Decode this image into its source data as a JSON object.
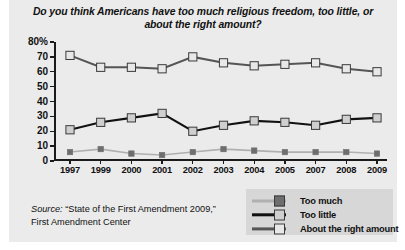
{
  "title": "Do you think Americans have too much religious freedom, too little, or about the right amount?",
  "source": {
    "prefix": "Source:",
    "line1": " “State of the First Amendment 2009,”",
    "line2": "First Amendment Center"
  },
  "legend": {
    "items": [
      {
        "label": "Too much",
        "line_color": "#b0b0b0",
        "marker_color": "#6e6e6e"
      },
      {
        "label": "Too little",
        "line_color": "#111111",
        "marker_color": "#cfcfcf"
      },
      {
        "label": "About the right amount",
        "line_color": "#555555",
        "marker_color": "#e8e8e8"
      }
    ]
  },
  "axis": {
    "y_labels": [
      "80%",
      "70",
      "60",
      "50",
      "40",
      "30",
      "20",
      "10",
      "0"
    ],
    "y_values": [
      80,
      70,
      60,
      50,
      40,
      30,
      20,
      10,
      0
    ]
  },
  "chart_data": {
    "type": "line",
    "title": "Do you think Americans have too much religious freedom, too little, or about the right amount?",
    "xlabel": "",
    "ylabel": "",
    "ylim": [
      0,
      80
    ],
    "ytick_interval": 10,
    "grid": false,
    "legend_position": "bottom-right",
    "categories": [
      "1997",
      "1999",
      "2000",
      "2001",
      "2002",
      "2003",
      "2004",
      "2005",
      "2007",
      "2008",
      "2009"
    ],
    "series": [
      {
        "name": "About the right amount",
        "values": [
          71,
          63,
          63,
          62,
          70,
          66,
          64,
          65,
          66,
          62,
          60
        ],
        "line_color": "#555555",
        "marker_color": "#e8e8e8",
        "marker_size": "large"
      },
      {
        "name": "Too much",
        "values": [
          21,
          26,
          29,
          32,
          20,
          24,
          27,
          26,
          24,
          28,
          29
        ],
        "line_color": "#111111",
        "marker_color": "#cfcfcf",
        "marker_size": "large"
      },
      {
        "name": "Too little",
        "values": [
          6,
          8,
          5,
          4,
          6,
          8,
          7,
          6,
          6,
          6,
          5
        ],
        "line_color": "#b0b0b0",
        "marker_color": "#6e6e6e",
        "marker_size": "small"
      }
    ]
  }
}
